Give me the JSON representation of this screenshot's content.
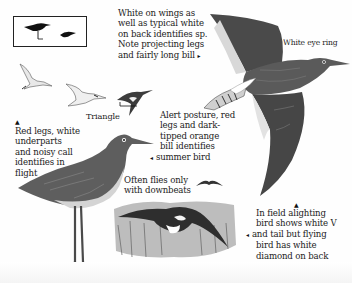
{
  "illustration": {
    "subject": "Redshank field guide plate",
    "captions": {
      "white_on_wings": {
        "lines": [
          "White on wings as",
          "well as typical white",
          "on back identifies sp.",
          "Note projecting legs",
          "and fairly long bill"
        ],
        "pointer": "▸"
      },
      "white_eye_ring": {
        "text": "White eye ring"
      },
      "triangle": {
        "text": "Triangle"
      },
      "red_legs": {
        "pointer": "▲",
        "lines": [
          "Red legs, white",
          "underparts",
          "and noisy call",
          "identifies in",
          "flight"
        ]
      },
      "alert_posture": {
        "lines": [
          "Alert posture, red",
          "legs and dark-",
          "tipped orange",
          "bill identifies",
          "summer bird"
        ],
        "pointer": "◂"
      },
      "downbeats": {
        "lines": [
          "Often flies only",
          "with downbeats"
        ]
      },
      "alighting": {
        "pointer_up": "▲",
        "pointer_left": "◂",
        "lines": [
          "In field alighting",
          "bird shows white V",
          "and tail but flying",
          "bird has white",
          "diamond on back"
        ]
      }
    },
    "colors": {
      "ink": "#1c1c1c",
      "bird_dark": "#3a3a3a",
      "bird_mid": "#6b6b6b",
      "bird_light": "#b9b9b9",
      "background": "#fefefe"
    }
  }
}
